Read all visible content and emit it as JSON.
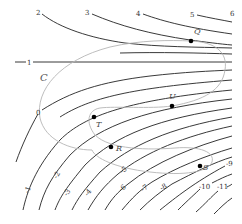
{
  "figure": {
    "type": "contour-map",
    "curve_label": "C",
    "contour_levels": {
      "positive": [
        "2",
        "3",
        "4",
        "5",
        "6"
      ],
      "one": "1",
      "zero": "0",
      "negative": [
        "-1",
        "-2",
        "-3",
        "-4",
        "-5",
        "-6",
        "-7",
        "-8",
        "-9",
        "-10",
        "-11"
      ]
    },
    "points": [
      {
        "name": "Q",
        "x": 191,
        "y": 41
      },
      {
        "name": "U",
        "x": 172,
        "y": 106
      },
      {
        "name": "T",
        "x": 94,
        "y": 117
      },
      {
        "name": "R",
        "x": 111,
        "y": 147
      },
      {
        "name": "S",
        "x": 200,
        "y": 166
      }
    ],
    "colors": {
      "contour": "#222222",
      "curve_C": "#b5b5b5",
      "point": "#000000",
      "background": "#ffffff"
    }
  }
}
